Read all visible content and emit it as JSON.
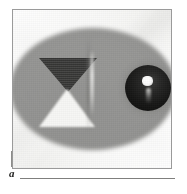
{
  "figure": {
    "panel_letter": "a",
    "caption_rule_visible": true,
    "type": "grayscale-photographic-panel",
    "background_color": "#f4f4f2",
    "frame_color": "#9a9a9a",
    "rule_color": "#7f7f7d"
  },
  "scene": {
    "ellipse": {
      "name": "gray-elliptical-region",
      "fill_color": "#949492",
      "edge": "soft-blurred",
      "center_x_pct": 48,
      "center_y_pct": 50,
      "width_px": 166,
      "height_px": 122
    },
    "objects": [
      {
        "id": "triangle-down",
        "shape": "triangle",
        "orientation": "pointing-down",
        "color": "#2e2e2d",
        "tone": "dark",
        "position": "upper-left"
      },
      {
        "id": "triangle-up",
        "shape": "triangle",
        "orientation": "pointing-up",
        "color": "#f6f6f4",
        "tone": "white",
        "position": "lower-left"
      },
      {
        "id": "center-streak",
        "shape": "vertical-streak",
        "color": "#e0e0de",
        "tone": "bright",
        "position": "center"
      },
      {
        "id": "sphere",
        "shape": "sphere",
        "color": "#1a1a19",
        "tone": "dark-glossy",
        "position": "right",
        "highlight_color": "#ffffff"
      }
    ]
  }
}
